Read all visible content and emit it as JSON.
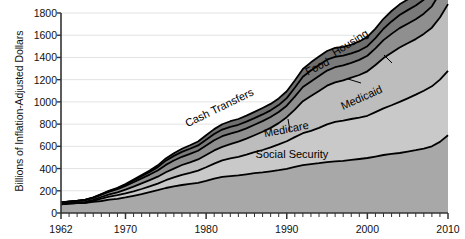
{
  "chart_data": {
    "type": "area",
    "stacked": true,
    "title": "",
    "xlabel": "",
    "ylabel": "Billions of Inflation-Adjusted Dollars",
    "xlim": [
      1962,
      2010
    ],
    "ylim": [
      0,
      1800
    ],
    "ytick_step": 200,
    "yticks": [
      0,
      200,
      400,
      600,
      800,
      1000,
      1200,
      1400,
      1600,
      1800
    ],
    "ytick_labels": [
      "0",
      "200",
      "400",
      "600",
      "800",
      "1000",
      "1200",
      "1400",
      "1600",
      "1800"
    ],
    "xticks": [
      1962,
      1970,
      1980,
      1990,
      2000,
      2010
    ],
    "xtick_labels": [
      "1962",
      "1970",
      "1980",
      "1990",
      "2000",
      "2010"
    ],
    "x_minor_ticks_every_year": true,
    "grid": "horizontal",
    "legend_position": "inline-labels",
    "x": [
      1962,
      1963,
      1964,
      1965,
      1966,
      1967,
      1968,
      1969,
      1970,
      1971,
      1972,
      1973,
      1974,
      1975,
      1976,
      1977,
      1978,
      1979,
      1980,
      1981,
      1982,
      1983,
      1984,
      1985,
      1986,
      1987,
      1988,
      1989,
      1990,
      1991,
      1992,
      1993,
      1994,
      1995,
      1996,
      1997,
      1998,
      1999,
      2000,
      2001,
      2002,
      2003,
      2004,
      2005,
      2006,
      2007,
      2008,
      2009,
      2010
    ],
    "series": [
      {
        "name": "Social Security",
        "color": "#a8a8a8",
        "label_style": "horizontal",
        "values": [
          78,
          84,
          88,
          92,
          100,
          108,
          120,
          128,
          140,
          155,
          170,
          188,
          205,
          225,
          240,
          252,
          262,
          272,
          290,
          310,
          325,
          332,
          338,
          348,
          358,
          365,
          375,
          385,
          398,
          415,
          430,
          440,
          448,
          458,
          465,
          470,
          478,
          486,
          495,
          508,
          522,
          532,
          540,
          552,
          565,
          580,
          600,
          640,
          700
        ]
      },
      {
        "name": "Medicare",
        "color": "#c9c9c9",
        "label_style": "rotated",
        "values": [
          0,
          0,
          0,
          0,
          8,
          22,
          28,
          32,
          36,
          40,
          46,
          52,
          60,
          70,
          80,
          92,
          100,
          110,
          122,
          135,
          148,
          160,
          168,
          178,
          190,
          202,
          215,
          232,
          248,
          268,
          288,
          300,
          318,
          340,
          355,
          362,
          368,
          372,
          380,
          400,
          420,
          438,
          460,
          480,
          500,
          520,
          540,
          560,
          580
        ]
      },
      {
        "name": "Medicaid",
        "color": "#bdbdbd",
        "label_style": "rotated",
        "values": [
          4,
          5,
          6,
          8,
          10,
          14,
          20,
          26,
          34,
          42,
          50,
          56,
          62,
          72,
          80,
          88,
          94,
          100,
          110,
          118,
          122,
          128,
          136,
          144,
          152,
          164,
          176,
          192,
          216,
          248,
          288,
          312,
          332,
          348,
          356,
          362,
          372,
          384,
          400,
          424,
          452,
          472,
          490,
          496,
          500,
          512,
          528,
          560,
          600
        ]
      },
      {
        "name": "Cash Transfers",
        "color": "#8f8f8f",
        "label_style": "rotated-leader",
        "values": [
          12,
          13,
          14,
          16,
          18,
          20,
          24,
          28,
          34,
          40,
          46,
          50,
          56,
          66,
          72,
          74,
          76,
          78,
          86,
          92,
          96,
          94,
          92,
          92,
          94,
          96,
          98,
          100,
          104,
          116,
          128,
          132,
          134,
          136,
          136,
          134,
          134,
          136,
          140,
          150,
          162,
          170,
          174,
          176,
          178,
          182,
          192,
          220,
          240
        ]
      },
      {
        "name": "Food",
        "color": "#7a7a7a",
        "label_style": "rotated-leader",
        "values": [
          1,
          1,
          2,
          2,
          3,
          4,
          6,
          8,
          11,
          16,
          20,
          24,
          30,
          38,
          42,
          44,
          46,
          48,
          52,
          56,
          60,
          62,
          60,
          60,
          60,
          60,
          60,
          62,
          68,
          80,
          92,
          98,
          100,
          98,
          94,
          88,
          84,
          84,
          86,
          92,
          102,
          112,
          118,
          122,
          124,
          126,
          136,
          164,
          186
        ]
      },
      {
        "name": "Housing",
        "color": "#6e6e6e",
        "label_style": "rotated-leader",
        "values": [
          1,
          1,
          1,
          2,
          2,
          3,
          3,
          4,
          6,
          8,
          10,
          13,
          16,
          20,
          24,
          28,
          32,
          36,
          40,
          44,
          48,
          50,
          52,
          54,
          56,
          58,
          58,
          60,
          62,
          66,
          70,
          74,
          76,
          78,
          80,
          80,
          80,
          82,
          84,
          86,
          90,
          94,
          96,
          96,
          98,
          100,
          104,
          112,
          120
        ]
      }
    ],
    "labels_on_plot": [
      {
        "text": "Social Security",
        "x": 292,
        "y": 158,
        "rotation": 0
      },
      {
        "text": "Medicare",
        "x": 287,
        "y": 133,
        "rotation": -11
      },
      {
        "text": "Medicaid",
        "x": 363,
        "y": 101,
        "rotation": -24
      },
      {
        "text": "Cash Transfers",
        "x": 221,
        "y": 111,
        "rotation": -26
      },
      {
        "text": "Food",
        "x": 319,
        "y": 70,
        "rotation": -27
      },
      {
        "text": "Housing",
        "x": 352,
        "y": 46,
        "rotation": -32
      }
    ],
    "leader_lines": [
      {
        "from_x": 288,
        "from_y": 119,
        "to_x": 290,
        "to_y": 131
      },
      {
        "from_x": 348,
        "from_y": 79,
        "to_x": 361,
        "to_y": 83
      },
      {
        "from_x": 384,
        "from_y": 55,
        "to_x": 392,
        "to_y": 63
      }
    ]
  },
  "axes": {
    "y_axis_title": "Billions of Inflation-Adjusted Dollars",
    "y_labels": [
      "1800",
      "1600",
      "1400",
      "1200",
      "1000",
      "800",
      "600",
      "400",
      "200",
      "0"
    ],
    "x_labels": [
      "1962",
      "1970",
      "1980",
      "1990",
      "2000",
      "2010"
    ]
  },
  "colors": {
    "axis": "#333333",
    "grid": "#e2e2e2",
    "outline": "#000000",
    "background": "#ffffff",
    "social_security": "#a8a8a8",
    "medicare": "#c9c9c9",
    "medicaid": "#bdbdbd",
    "cash_transfers": "#8f8f8f",
    "food": "#7a7a7a",
    "housing": "#6e6e6e"
  }
}
